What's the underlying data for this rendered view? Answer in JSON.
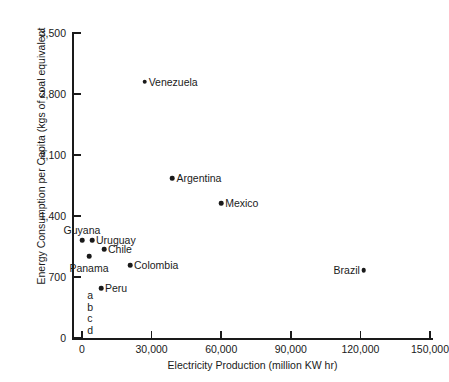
{
  "chart_data": {
    "type": "scatter",
    "title": "",
    "xlabel": "Electricity Production (million KW hr)",
    "ylabel": "Energy Consumption per Capita (kgs of coal equivalent",
    "xlim": [
      0,
      150000
    ],
    "ylim": [
      0,
      3500
    ],
    "grid": false,
    "legend": "none",
    "xticks": [
      {
        "value": 0,
        "label": "0"
      },
      {
        "value": 30000,
        "label": "30,000"
      },
      {
        "value": 60000,
        "label": "60,000"
      },
      {
        "value": 90000,
        "label": "90,000"
      },
      {
        "value": 120000,
        "label": "120,000"
      },
      {
        "value": 150000,
        "label": "150,000"
      }
    ],
    "yticks": [
      {
        "value": 0,
        "label": "0"
      },
      {
        "value": 700,
        "label": "700"
      },
      {
        "value": 1400,
        "label": "1,400"
      },
      {
        "value": 2100,
        "label": "2,100"
      },
      {
        "value": 2800,
        "label": "2,800"
      },
      {
        "value": 3500,
        "label": "3,500"
      }
    ],
    "points": [
      {
        "label": "Venezuela",
        "x": 27000,
        "y": 2940,
        "label_pos": "right"
      },
      {
        "label": "Argentina",
        "x": 39000,
        "y": 1835,
        "label_pos": "right"
      },
      {
        "label": "Mexico",
        "x": 60000,
        "y": 1550,
        "label_pos": "right"
      },
      {
        "label": "Brazil",
        "x": 121500,
        "y": 780,
        "label_pos": "left"
      },
      {
        "label": "Guyana",
        "x": 0,
        "y": 1125,
        "label_pos": "above"
      },
      {
        "label": "Uruguay",
        "x": 4300,
        "y": 1125,
        "label_pos": "right"
      },
      {
        "label": "Chile",
        "x": 9500,
        "y": 1020,
        "label_pos": "right"
      },
      {
        "label": "Panama",
        "x": 3000,
        "y": 940,
        "label_pos": "below"
      },
      {
        "label": "Colombia",
        "x": 20700,
        "y": 838,
        "label_pos": "right"
      },
      {
        "label": "Peru",
        "x": 8200,
        "y": 574,
        "label_pos": "right"
      }
    ],
    "annotations": [
      {
        "text": "a",
        "x": 2300,
        "y": 490
      },
      {
        "text": "b",
        "x": 2300,
        "y": 355
      },
      {
        "text": "c",
        "x": 2300,
        "y": 225
      },
      {
        "text": "d",
        "x": 2300,
        "y": 95
      }
    ]
  }
}
